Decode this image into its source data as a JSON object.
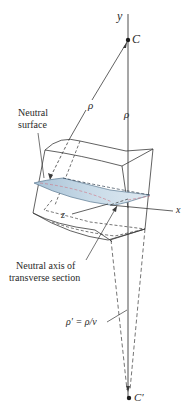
{
  "diagram": {
    "labels": {
      "y_axis": "y",
      "x_axis": "x",
      "z_axis": "z",
      "center_C": "C",
      "center_C_prime": "C′",
      "rho_slanted": "ρ",
      "rho_vertical": "ρ",
      "neutral_surface_line1": "Neutral",
      "neutral_surface_line2": "surface",
      "neutral_axis_line1": "Neutral axis of",
      "neutral_axis_line2": "transverse section",
      "rho_prime_formula": "ρ′ = ρ/ν"
    },
    "colors": {
      "line": "#3a3a3a",
      "surface_fill": "#b9cfe0",
      "surface_edge": "#5a7890",
      "neutral_axis_red": "#d07080"
    }
  }
}
